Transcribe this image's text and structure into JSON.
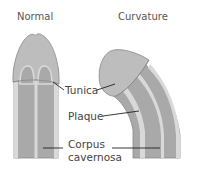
{
  "diagram": {
    "panels": [
      {
        "title": "Normal"
      },
      {
        "title": "Curvature"
      }
    ],
    "labels": {
      "tunica": "Tunica",
      "plaque": "Plaque",
      "corpus_line1": "Corpus",
      "corpus_line2": "cavernosa"
    },
    "colors": {
      "glans": "#bdbdbd",
      "shaft": "#a9a9a9",
      "tunica": "#d9d9d9",
      "outline": "#8a8a8a",
      "leader": "#222222"
    }
  }
}
